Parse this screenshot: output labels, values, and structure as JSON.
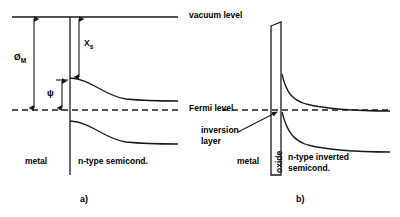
{
  "figure": {
    "title_a": "a)",
    "title_b": "b)",
    "levels": {
      "vacuum_level": "vacuum level",
      "fermi_level": "Fermi level"
    },
    "panel_a": {
      "caption": "a)",
      "energy_labels": [
        {
          "symbol": "Ø",
          "subscript": "M",
          "name": "metal-work-function"
        },
        {
          "symbol": "X",
          "subscript": "s",
          "name": "electron-affinity"
        },
        {
          "symbol": "ψ",
          "subscript": "",
          "name": "band-bending-potential"
        }
      ],
      "region_left": "metal",
      "region_right": "n-type semicond."
    },
    "panel_b": {
      "caption": "b)",
      "region_left": "metal",
      "region_middle": "oxide",
      "region_right_line1": "n-type inverted",
      "region_right_line2": "semicond.",
      "annotation_line1": "inversion",
      "annotation_line2": "layer"
    },
    "colors": {
      "line": "#1a1a1a",
      "background": "#ffffff",
      "text": "#000000"
    }
  }
}
